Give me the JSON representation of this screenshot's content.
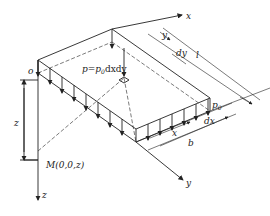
{
  "figure": {
    "type": "isometric diagram of rectangular uniform load on half-space",
    "colors": {
      "line": "#222222",
      "background": "#ffffff"
    }
  },
  "labels": {
    "origin": "o",
    "x_axis": "x",
    "y_axis": "y",
    "z_axis": "z",
    "point_load": "p=p",
    "point_load_sub": "0",
    "point_load_tail": "dxdy",
    "depth": "z",
    "point_m": "M(0,0,z)",
    "pressure": "p",
    "pressure_sub": "0",
    "dim_y": "y",
    "dim_dy": "dy",
    "dim_l": "l",
    "dim_x": "x",
    "dim_dx": "dx",
    "dim_b": "b"
  }
}
